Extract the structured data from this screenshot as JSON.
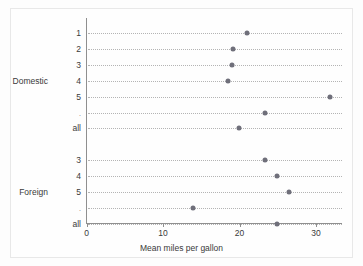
{
  "chart_data": {
    "type": "scatter",
    "title": "",
    "subtitle": "",
    "xlabel": "Mean miles per gallon",
    "ylabel": "",
    "xlim": [
      0,
      33.5
    ],
    "xticks": [
      0,
      10,
      20,
      30
    ],
    "xtick_labels": [
      "0",
      "10",
      "20",
      "30"
    ],
    "grid": "horizontal-dotted",
    "legend": "none",
    "orientation": "horizontal",
    "groups": [
      {
        "name": "Domestic",
        "rows": [
          {
            "label": "1",
            "value": 21.0
          },
          {
            "label": "2",
            "value": 19.1
          },
          {
            "label": "3",
            "value": 19.0
          },
          {
            "label": "4",
            "value": 18.5
          },
          {
            "label": "5",
            "value": 31.8
          },
          {
            "label": ".",
            "value": 23.3
          },
          {
            "label": "all",
            "value": 19.9
          }
        ]
      },
      {
        "name": "Foreign",
        "rows": [
          {
            "label": "3",
            "value": 23.3
          },
          {
            "label": "4",
            "value": 24.9
          },
          {
            "label": "5",
            "value": 26.5
          },
          {
            "label": ".",
            "value": 13.9
          },
          {
            "label": "all",
            "value": 24.9
          }
        ]
      }
    ],
    "colors": {
      "marker": "#6f6f7a",
      "axis": "#8f8f8f",
      "grid": "#b4b4b4",
      "text": "#3a3a3a",
      "background": "#fdfdfd",
      "frame": "#e8e8e8"
    }
  }
}
